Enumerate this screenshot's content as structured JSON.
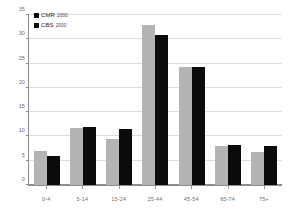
{
  "chart_data": {
    "type": "bar",
    "title": "",
    "subtitle": "",
    "xlabel": "",
    "ylabel": "",
    "categories": [
      "0-4",
      "5-14",
      "15-24",
      "25-44",
      "45-54",
      "65-74",
      "75+"
    ],
    "series": [
      {
        "name": "CMR",
        "year": "2000",
        "color": "#b4b4b4",
        "legend_swatch_color": "#0b0b0b",
        "values": [
          7.0,
          11.8,
          9.5,
          33.0,
          24.3,
          8.1,
          6.8
        ]
      },
      {
        "name": "CBS",
        "year": "2000",
        "color": "#0b0b0b",
        "legend_swatch_color": "#0b0b0b",
        "values": [
          6.0,
          12.0,
          11.6,
          30.8,
          24.2,
          8.3,
          8.0
        ]
      }
    ],
    "ylim": [
      0,
      35
    ],
    "yticks": [
      0,
      5,
      10,
      15,
      20,
      25,
      30,
      35
    ],
    "ytick_labels": [
      "0",
      "5",
      "10",
      "15",
      "20",
      "25",
      "30",
      "35"
    ],
    "grid": true,
    "legend_position": "top-left",
    "axis_color": "#8d8d8d",
    "grid_color": "#dcdcdc",
    "background": "#ffffff"
  },
  "legend": {
    "entries": [
      {
        "label": "CMR",
        "year": "2000"
      },
      {
        "label": "CBS",
        "year": "2000"
      }
    ]
  }
}
